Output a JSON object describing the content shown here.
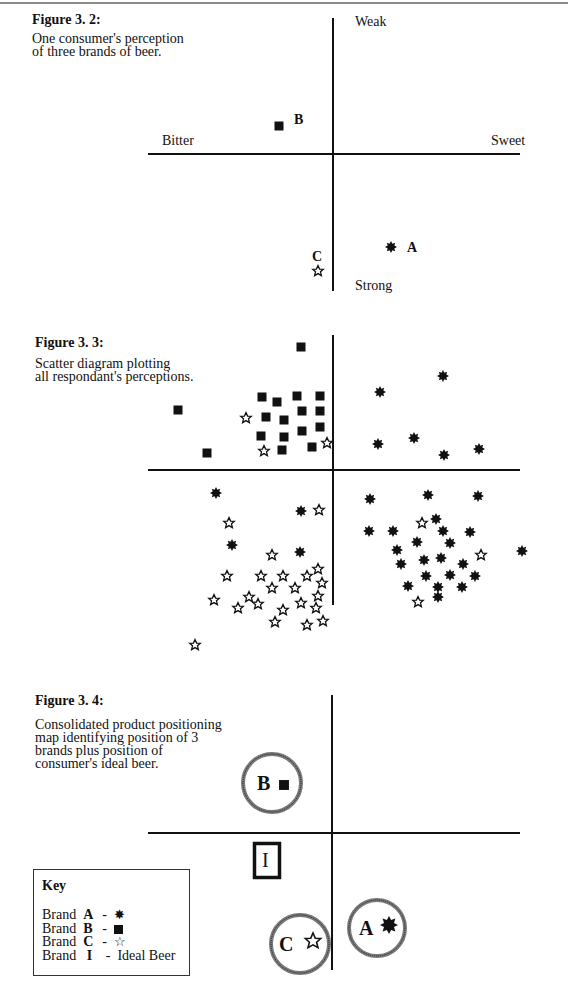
{
  "page": {
    "colors": {
      "ink": "#111111",
      "ring": "#7a7a7a",
      "rule": "#8a8a8a"
    }
  },
  "figure_3_2": {
    "title": "Figure 3. 2:",
    "description": "One consumer's perception\nof three brands of beer.",
    "axes": {
      "top_label": "Weak",
      "bottom_label": "Strong",
      "left_label": "Bitter",
      "right_label": "Sweet"
    },
    "points": [
      {
        "brand": "B",
        "marker": "square",
        "label": "B"
      },
      {
        "brand": "A",
        "marker": "asterisk",
        "label": "A"
      },
      {
        "brand": "C",
        "marker": "star",
        "label": "C"
      }
    ]
  },
  "figure_3_3": {
    "title": "Figure 3. 3:",
    "description": "Scatter diagram plotting\nall respondant's perceptions."
  },
  "figure_3_4": {
    "title": "Figure 3. 4:",
    "description": "Consolidated product positioning\nmap identifying position of 3\nbrands plus position of\nconsumer's ideal beer.",
    "positions": [
      {
        "brand": "B",
        "label": "B",
        "marker": "square"
      },
      {
        "brand": "I",
        "label": "I",
        "marker": "box"
      },
      {
        "brand": "C",
        "label": "C",
        "marker": "star"
      },
      {
        "brand": "A",
        "label": "A",
        "marker": "asterisk"
      }
    ],
    "key": {
      "title": "Key",
      "rows": [
        {
          "prefix": "Brand",
          "letter": "A",
          "sep": "-",
          "symbol": "asterisk",
          "text": ""
        },
        {
          "prefix": "Brand",
          "letter": "B",
          "sep": "-",
          "symbol": "square",
          "text": ""
        },
        {
          "prefix": "Brand",
          "letter": "C",
          "sep": "-",
          "symbol": "star",
          "text": ""
        },
        {
          "prefix": "Brand",
          "letter": "I",
          "sep": "-",
          "symbol": "",
          "text": "Ideal Beer"
        }
      ]
    }
  },
  "chart_data": [
    {
      "type": "scatter",
      "title": "Figure 3. 2: One consumer's perception of three brands of beer.",
      "xlabel": "Bitter (left) — Sweet (right)",
      "ylabel": "Weak (top) — Strong (bottom)",
      "origin_px": [
        333,
        154
      ],
      "series": [
        {
          "name": "Brand A",
          "marker": "asterisk",
          "points_px": [
            [
              391,
              247
            ]
          ]
        },
        {
          "name": "Brand B",
          "marker": "square",
          "points_px": [
            [
              279,
              126
            ]
          ]
        },
        {
          "name": "Brand C",
          "marker": "star",
          "points_px": [
            [
              318,
              271
            ]
          ]
        }
      ],
      "labels_px": {
        "A": [
          407,
          252
        ],
        "B": [
          294,
          124
        ],
        "C": [
          312,
          261
        ]
      },
      "axes_px": {
        "h": [
          148,
          520,
          154
        ],
        "v": [
          333,
          18,
          291
        ]
      },
      "axis_labels_px": {
        "Weak": [
          355,
          26
        ],
        "Strong": [
          355,
          290
        ],
        "Bitter": [
          162,
          145
        ],
        "Sweet": [
          491,
          145
        ]
      }
    },
    {
      "type": "scatter",
      "title": "Figure 3. 3: Scatter diagram plotting all respondant's perceptions.",
      "origin_px": [
        333,
        470
      ],
      "axes_px": {
        "h": [
          148,
          520,
          470
        ],
        "v": [
          333,
          335,
          605
        ]
      },
      "series": [
        {
          "name": "Brand A",
          "marker": "asterisk",
          "points_px": [
            [
              380,
              392
            ],
            [
              443,
              376
            ],
            [
              378,
              444
            ],
            [
              414,
              438
            ],
            [
              444,
              455
            ],
            [
              479,
              449
            ],
            [
              216,
              493
            ],
            [
              301,
              511
            ],
            [
              232,
              545
            ],
            [
              300,
              552
            ],
            [
              370,
              499
            ],
            [
              428,
              495
            ],
            [
              478,
              496
            ],
            [
              436,
              519
            ],
            [
              369,
              531
            ],
            [
              393,
              531
            ],
            [
              443,
              531
            ],
            [
              470,
              532
            ],
            [
              417,
              542
            ],
            [
              450,
              543
            ],
            [
              397,
              550
            ],
            [
              401,
              564
            ],
            [
              424,
              560
            ],
            [
              441,
              558
            ],
            [
              463,
              564
            ],
            [
              522,
              551
            ],
            [
              426,
              576
            ],
            [
              450,
              575
            ],
            [
              475,
              576
            ],
            [
              408,
              586
            ],
            [
              438,
              587
            ],
            [
              462,
              587
            ],
            [
              438,
              597
            ]
          ]
        },
        {
          "name": "Brand B",
          "marker": "square",
          "points_px": [
            [
              301,
              347
            ],
            [
              178,
              410
            ],
            [
              207,
              453
            ],
            [
              262,
              397
            ],
            [
              277,
              402
            ],
            [
              297,
              396
            ],
            [
              320,
              396
            ],
            [
              266,
              417
            ],
            [
              284,
              420
            ],
            [
              302,
              411
            ],
            [
              320,
              411
            ],
            [
              261,
              436
            ],
            [
              284,
              437
            ],
            [
              302,
              431
            ],
            [
              320,
              427
            ],
            [
              312,
              447
            ],
            [
              282,
              450
            ]
          ]
        },
        {
          "name": "Brand C",
          "marker": "star",
          "points_px": [
            [
              246,
              418
            ],
            [
              264,
              451
            ],
            [
              327,
              443
            ],
            [
              319,
              510
            ],
            [
              229,
              523
            ],
            [
              272,
              555
            ],
            [
              422,
              523
            ],
            [
              481,
              555
            ],
            [
              418,
              602
            ],
            [
              227,
              576
            ],
            [
              261,
              576
            ],
            [
              283,
              576
            ],
            [
              307,
              576
            ],
            [
              318,
              569
            ],
            [
              272,
              588
            ],
            [
              295,
              588
            ],
            [
              322,
              583
            ],
            [
              214,
              600
            ],
            [
              249,
              597
            ],
            [
              258,
              604
            ],
            [
              238,
              608
            ],
            [
              301,
              603
            ],
            [
              318,
              596
            ],
            [
              316,
              608
            ],
            [
              283,
              610
            ],
            [
              275,
              622
            ],
            [
              307,
              625
            ],
            [
              323,
              621
            ],
            [
              195,
              645
            ]
          ]
        }
      ]
    },
    {
      "type": "scatter",
      "title": "Figure 3. 4: Consolidated product positioning map identifying position of 3 brands plus position of consumer's ideal beer.",
      "origin_px": [
        332,
        833
      ],
      "axes_px": {
        "h": [
          148,
          520,
          833
        ],
        "v": [
          332,
          695,
          970
        ]
      },
      "series": [
        {
          "name": "Brand B",
          "marker": "square",
          "circle_center_px": [
            272,
            783
          ],
          "radius_px": 31
        },
        {
          "name": "Brand A",
          "marker": "asterisk",
          "circle_center_px": [
            377,
            928
          ],
          "radius_px": 30
        },
        {
          "name": "Brand C",
          "marker": "star",
          "circle_center_px": [
            300,
            944
          ],
          "radius_px": 31
        },
        {
          "name": "Ideal Beer (I)",
          "marker": "box",
          "box_px": [
            253,
            842,
            280,
            879
          ]
        }
      ]
    }
  ]
}
